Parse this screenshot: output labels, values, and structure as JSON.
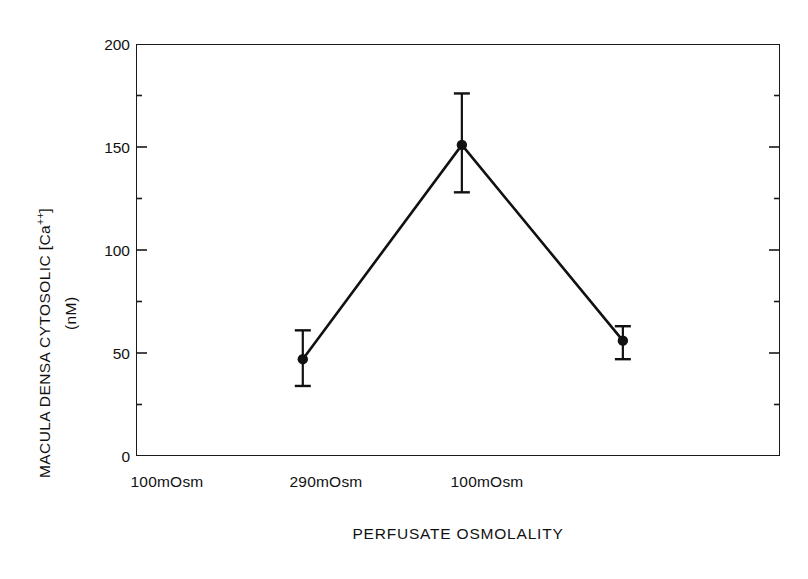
{
  "chart_data": {
    "type": "line",
    "title": "",
    "subtitle": "",
    "xlabel": "PERFUSATE OSMOLALITY",
    "ylabel": "MACULA DENSA CYTOSOLIC [Ca++]",
    "ylabel_units": "(nM)",
    "ylabel_text": "MACULA DENSA CYTOSOLIC [Ca",
    "ylabel_superscript": "++",
    "ylabel_bracket_close": "]",
    "categories": [
      "100mOsm",
      "290mOsm",
      "100mOsm"
    ],
    "values": [
      47,
      151,
      56
    ],
    "error_upper": [
      61,
      176,
      63
    ],
    "error_lower": [
      34,
      128,
      47
    ],
    "errors": [
      13,
      23,
      8
    ],
    "error_type": "SEM",
    "ylim": [
      0,
      200
    ],
    "ytick_labels": [
      "0",
      "50",
      "100",
      "150",
      "200"
    ],
    "ytick_values": [
      0,
      50,
      100,
      150,
      200
    ],
    "yminor_values": [
      25,
      75,
      125,
      175
    ],
    "grid": false,
    "legend": false,
    "legend_position": "none",
    "marker": "filled-circle",
    "line_color": "#111111",
    "marker_color": "#111111",
    "axis_color": "#1a1a1a",
    "background_color": "#ffffff",
    "ticks_side": "left-and-right",
    "xticks_visible": false
  },
  "figure": {
    "name": "macula-densa-calcium-line-chart"
  }
}
